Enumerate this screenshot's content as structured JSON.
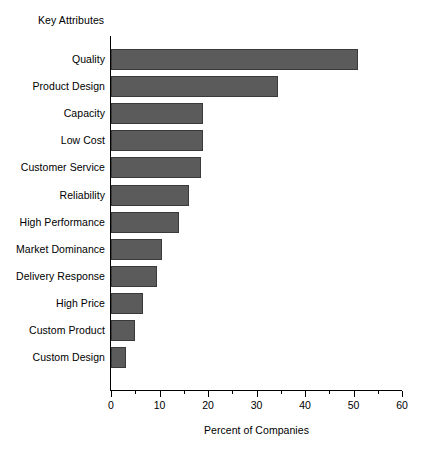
{
  "chart_data": {
    "type": "bar",
    "orientation": "horizontal",
    "title": "",
    "xlabel": "Percent of Companies",
    "ylabel": "Key Attributes",
    "xlim": [
      0,
      60
    ],
    "xticks": [
      0,
      10,
      20,
      30,
      40,
      50,
      60
    ],
    "xtick_labels": [
      "0",
      "10",
      "20",
      "30",
      "40",
      "50",
      "60"
    ],
    "minor_tick_step": 5,
    "grid": false,
    "legend": null,
    "bar_color": "#5b5b5b",
    "bar_edge_color": "#3a3a3a",
    "categories": [
      "Quality",
      "Product Design",
      "Capacity",
      "Low Cost",
      "Customer Service",
      "Reliability",
      "High Performance",
      "Market Dominance",
      "Delivery Response",
      "High Price",
      "Custom Product",
      "Custom Design"
    ],
    "values": [
      51,
      34.5,
      19,
      19,
      18.5,
      16,
      14,
      10.5,
      9.5,
      6.5,
      5,
      3
    ]
  }
}
